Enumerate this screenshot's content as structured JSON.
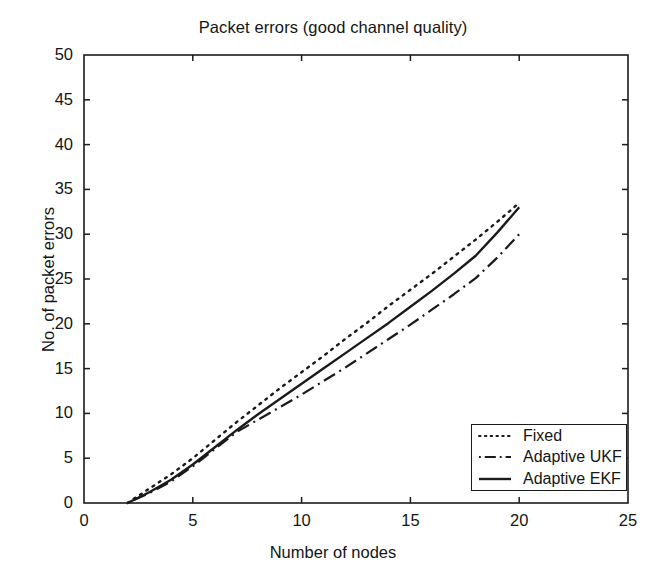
{
  "chart_data": {
    "type": "line",
    "title": "Packet errors (good channel quality)",
    "xlabel": "Number of nodes",
    "ylabel": "No. of packet errors",
    "xlim": [
      0,
      25
    ],
    "ylim": [
      0,
      50
    ],
    "xticks": [
      0,
      5,
      10,
      15,
      20,
      25
    ],
    "yticks": [
      0,
      5,
      10,
      15,
      20,
      25,
      30,
      35,
      40,
      45,
      50
    ],
    "grid": false,
    "legend_position": "lower right",
    "x": [
      2,
      3,
      4,
      5,
      6,
      7,
      8,
      9,
      10,
      11,
      12,
      13,
      14,
      15,
      16,
      17,
      18,
      19,
      20
    ],
    "series": [
      {
        "name": "Fixed",
        "style": "dotted",
        "color": "#1a1a1a",
        "values": [
          0,
          1.6,
          3.2,
          5.0,
          7.0,
          9.0,
          10.9,
          12.8,
          14.6,
          16.4,
          18.3,
          20.1,
          22.0,
          23.8,
          25.6,
          27.5,
          29.4,
          31.4,
          33.5
        ]
      },
      {
        "name": "Adaptive UKF",
        "style": "dash-dot",
        "color": "#1a1a1a",
        "values": [
          0,
          1.1,
          2.4,
          4.1,
          6.0,
          7.9,
          9.3,
          10.7,
          12.1,
          13.6,
          15.1,
          16.7,
          18.3,
          19.9,
          21.6,
          23.3,
          25.1,
          27.4,
          30.0
        ]
      },
      {
        "name": "Adaptive EKF",
        "style": "solid",
        "color": "#1a1a1a",
        "values": [
          0,
          1.2,
          2.6,
          4.3,
          6.2,
          8.1,
          9.9,
          11.6,
          13.3,
          15.0,
          16.7,
          18.4,
          20.1,
          21.9,
          23.7,
          25.6,
          27.6,
          30.2,
          33.0
        ]
      }
    ]
  },
  "legend": {
    "items": [
      {
        "label": "Fixed"
      },
      {
        "label": "Adaptive UKF"
      },
      {
        "label": "Adaptive EKF"
      }
    ]
  }
}
